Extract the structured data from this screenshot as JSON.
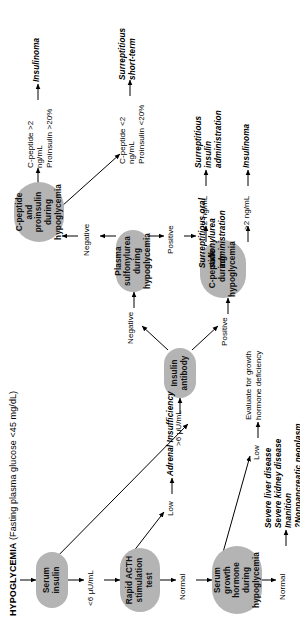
{
  "figure": {
    "title_main": "HYPOGLYCEMIA",
    "title_sub": " (Fasting plasma glucose <45 mg/dL)",
    "orientation": "rotated-90-ccw",
    "node_fill": "#b4b4b4",
    "background": "#ffffff",
    "text_color": "#000000"
  },
  "nodes": {
    "serum_insulin": "Serum insulin",
    "rapid_acth": "Rapid ACTH stimulation test",
    "serum_gh": "Serum growth hormone during hypoglycemia",
    "insulin_antibody": "Insulin antibody",
    "c_peptide": "C-peptide during hypoglycemia",
    "plasma_sulfonylurea": "Plasma sulfonylurea during hypoglycemia",
    "c_peptide_proinsulin": "C-peptide and proinsulin during hypoglycemia"
  },
  "edge_labels": {
    "insulin_low": "<6 µU/mL",
    "insulin_high": ">6 µU/mL",
    "acth_normal": "Normal",
    "acth_low": "Low",
    "gh_normal": "Normal",
    "gh_low": "Low",
    "antibody_positive": "Positive",
    "antibody_negative": "Negative",
    "cpep_high": ">2 ng/mL",
    "cpep_low": "<2 ng/mL",
    "sulf_positive": "Positive",
    "sulf_negative": "Negative",
    "cpp_high": "C-peptide >2 ng/mL\nProinsulin >20%",
    "cpp_low": "C-peptide <2 ng/mL\nProinsulin <20%"
  },
  "outcomes": {
    "adrenal_insufficiency": "Adrenal Insufficiency",
    "gh_eval": "Evaluate for growth hormone deficiency",
    "systemic_causes": "Severe liver disease\nSevere kidney disease\nInanition\n?Nonpancreatic neoplasm",
    "insulinoma_cpep": "Insulinoma",
    "surreptitious_insulin": "Surreptitious insulin administration",
    "surreptitious_sulfonylurea": "Surreptitious oral sulfonylurea administration",
    "insulinoma_proinsulin": "Insulinoma",
    "surreptitious_short_term": "Surreptitious short-term"
  }
}
